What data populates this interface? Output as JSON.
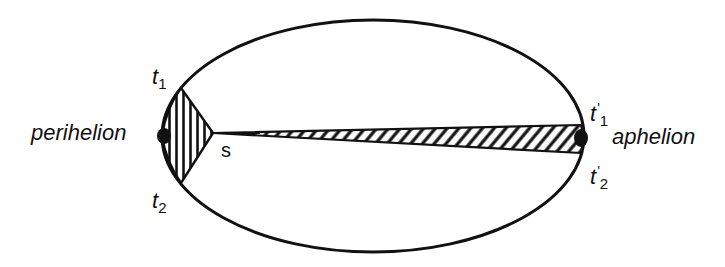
{
  "diagram": {
    "colors": {
      "stroke": "#111111",
      "background": "#ffffff"
    },
    "labels": {
      "perihelion": "perihelion",
      "aphelion": "aphelion",
      "sun": "s",
      "t1": {
        "base": "t",
        "sub": "1",
        "prime": ""
      },
      "t2": {
        "base": "t",
        "sub": "2",
        "prime": ""
      },
      "t1_prime": {
        "base": "t",
        "sub": "1",
        "prime": "'"
      },
      "t2_prime": {
        "base": "t",
        "sub": "2",
        "prime": "'"
      }
    }
  }
}
